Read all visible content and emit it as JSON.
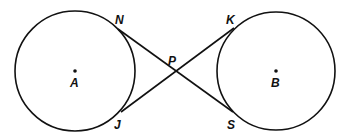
{
  "diagram": {
    "circles": [
      {
        "name": "A",
        "cx": 75,
        "cy": 70,
        "r": 60
      },
      {
        "name": "B",
        "cx": 276,
        "cy": 70,
        "r": 59
      }
    ],
    "points": {
      "N": {
        "x": 118,
        "y": 29,
        "lx": 115,
        "ly": 24
      },
      "J": {
        "x": 121,
        "y": 112,
        "lx": 114,
        "ly": 129
      },
      "K": {
        "x": 234,
        "y": 28,
        "lx": 226,
        "ly": 24
      },
      "S": {
        "x": 233,
        "y": 112,
        "lx": 227,
        "ly": 129
      },
      "P": {
        "x": 177,
        "y": 71,
        "lx": 168,
        "ly": 64
      },
      "A": {
        "x": 75,
        "y": 71,
        "lx": 70,
        "ly": 87
      },
      "B": {
        "x": 276,
        "y": 71,
        "lx": 271,
        "ly": 87
      }
    },
    "segments": [
      [
        "N",
        "S"
      ],
      [
        "J",
        "K"
      ]
    ],
    "labels": {
      "N": "N",
      "J": "J",
      "K": "K",
      "S": "S",
      "P": "P",
      "A": "A",
      "B": "B"
    }
  }
}
